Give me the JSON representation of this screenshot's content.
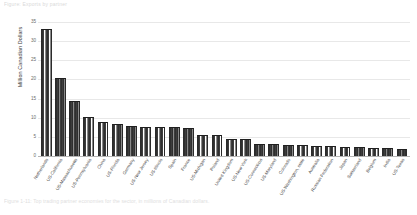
{
  "header": {
    "text": "Figure: Exports by partner"
  },
  "caption": {
    "text": "Figure 1-11: Top trading partner economies for the sector, in millions of Canadian dollars."
  },
  "chart_data": {
    "type": "bar",
    "title": "",
    "xlabel": "",
    "ylabel": "Million Canadian Dollars",
    "ylim": [
      0,
      35
    ],
    "yticks": [
      0,
      5,
      10,
      15,
      20,
      25,
      30,
      35
    ],
    "ytick_labels": [
      "0",
      "5",
      "10",
      "15",
      "20",
      "25",
      "30",
      "35"
    ],
    "grid": true,
    "legend": "none",
    "bar_color": "#404040",
    "categories": [
      "Netherlands",
      "US-California",
      "US-Massachusetts",
      "US-Pennsylvania",
      "China",
      "US-Florida",
      "Germany",
      "US-New Jersey",
      "US-Illinois",
      "Spain",
      "France",
      "US-Michigan",
      "Poland",
      "United Kingdom",
      "US-New York",
      "US-Connecticut",
      "US-Maryland",
      "Colorado",
      "US-Washington, state",
      "Australia",
      "Russian Federation",
      "Japan",
      "Switzerland",
      "Belgium",
      "India",
      "US-Texas"
    ],
    "labeled_categories": [
      "Netherlands",
      "",
      "US-California",
      "",
      "US-Massachusetts",
      "",
      "US-Pennsylvania",
      "",
      "China",
      "",
      "US-Florida",
      "",
      "Germany",
      "",
      "US-New Jersey",
      "",
      "US-Illinois",
      "",
      "Spain",
      "",
      "France",
      "",
      "US-Michigan",
      "",
      "Poland",
      "",
      "United Kingdom",
      "",
      "US-New York",
      "",
      "US-Connecticut",
      "",
      "US-Maryland",
      "",
      "Colorado",
      "",
      "US-Washington, state",
      "",
      "Australia",
      "",
      "Russian Federation",
      "",
      "Japan",
      "",
      "Switzerland",
      "",
      "Belgium",
      "",
      "India",
      "",
      "US-Texas"
    ],
    "values": [
      33.0,
      20.1,
      14.2,
      9.8,
      8.6,
      8.0,
      7.6,
      7.4,
      7.3,
      7.2,
      7.0,
      5.2,
      5.1,
      4.3,
      4.1,
      3.0,
      2.8,
      2.7,
      2.5,
      2.4,
      2.3,
      2.1,
      2.0,
      1.9,
      1.8,
      1.6
    ]
  }
}
